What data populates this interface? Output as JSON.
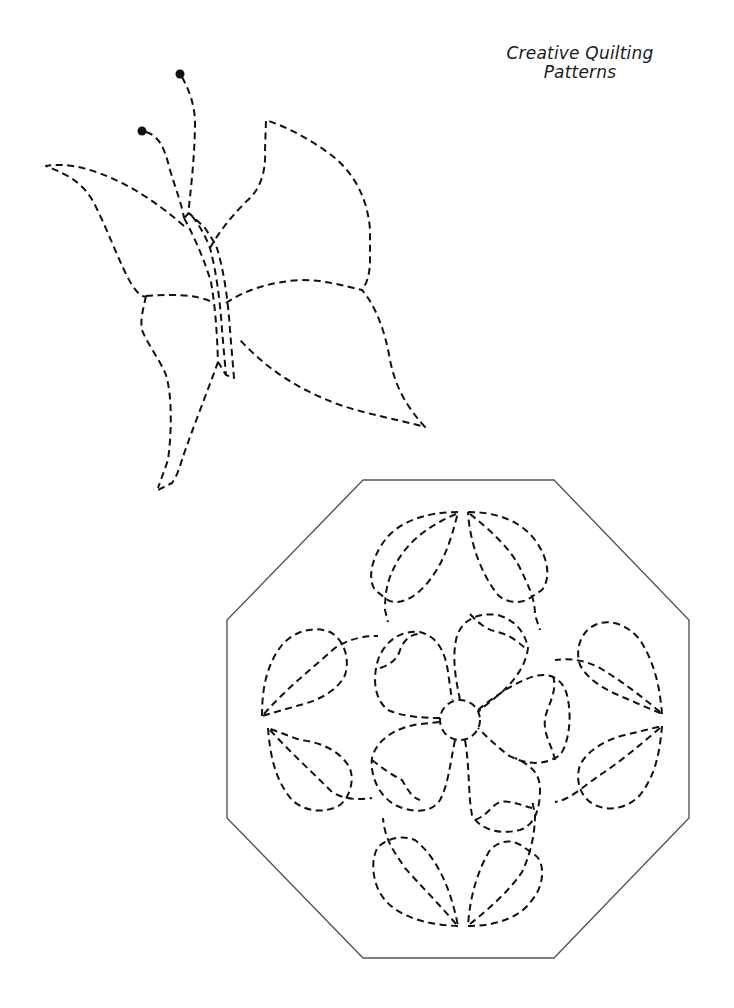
{
  "page": {
    "title_line1": "Creative Quilting",
    "title_line2": "Patterns",
    "background": "#ffffff",
    "stitch_color": "#111111",
    "border_color": "#555555"
  },
  "patterns": [
    {
      "name": "Butterfly",
      "style": "dashed-stitch-line",
      "elements": [
        "two antennae with dot tips",
        "body",
        "upper left wing",
        "lower left wing",
        "upper right wing",
        "lower right wing"
      ]
    },
    {
      "name": "Octagon Flower Block",
      "style": "dashed-stitch-line",
      "border": "solid octagon",
      "elements": [
        "center circle",
        "five heart-shaped petals",
        "four leaf pairs (top, right, bottom, left)",
        "connecting stems"
      ]
    }
  ]
}
